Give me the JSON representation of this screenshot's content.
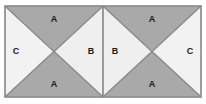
{
  "figure": {
    "canvas": {
      "width": 206,
      "height": 104
    },
    "frame": {
      "x": 5,
      "y": 6,
      "width": 196,
      "height": 91,
      "stroke": "#8c8c8c",
      "stroke_width": 1.2
    },
    "center_divider": {
      "x": 103,
      "y1": 6,
      "y2": 97,
      "stroke": "#8c8c8c",
      "stroke_width": 1.2
    },
    "colors": {
      "background": "#ffffff",
      "dark_fill": "#a9a9a9",
      "light_fill": "#efefef",
      "light_fill_alt": "#f2f2f2",
      "outline": "#8c8c8c",
      "label_text": "#1a1a1a"
    },
    "squares": [
      {
        "name": "left-square",
        "x": 5,
        "y": 6,
        "width": 98,
        "height": 91,
        "center_x": 54,
        "center_y": 51.5,
        "triangles": [
          {
            "name": "left-top-triangle",
            "label": "A",
            "fill": "dark",
            "label_x": 54,
            "label_y": 20
          },
          {
            "name": "left-bottom-triangle",
            "label": "A",
            "fill": "dark",
            "label_x": 54,
            "label_y": 84
          },
          {
            "name": "left-outer-triangle",
            "label": "C",
            "fill": "light",
            "label_x": 16,
            "label_y": 52
          },
          {
            "name": "left-inner-triangle",
            "label": "B",
            "fill": "light",
            "label_x": 91,
            "label_y": 52
          }
        ]
      },
      {
        "name": "right-square",
        "x": 103,
        "y": 6,
        "width": 98,
        "height": 91,
        "center_x": 152,
        "center_y": 51.5,
        "triangles": [
          {
            "name": "right-top-triangle",
            "label": "A",
            "fill": "dark",
            "label_x": 152,
            "label_y": 20
          },
          {
            "name": "right-bottom-triangle",
            "label": "A",
            "fill": "dark",
            "label_x": 152,
            "label_y": 84
          },
          {
            "name": "right-inner-triangle",
            "label": "B",
            "fill": "light",
            "label_x": 115,
            "label_y": 52
          },
          {
            "name": "right-outer-triangle",
            "label": "C",
            "fill": "light",
            "label_x": 190,
            "label_y": 52
          }
        ]
      }
    ],
    "labels": {
      "a_top_left": "A",
      "a_bottom_left": "A",
      "c_left": "C",
      "b_left": "B",
      "a_top_right": "A",
      "a_bottom_right": "A",
      "b_right": "B",
      "c_right": "C"
    }
  }
}
